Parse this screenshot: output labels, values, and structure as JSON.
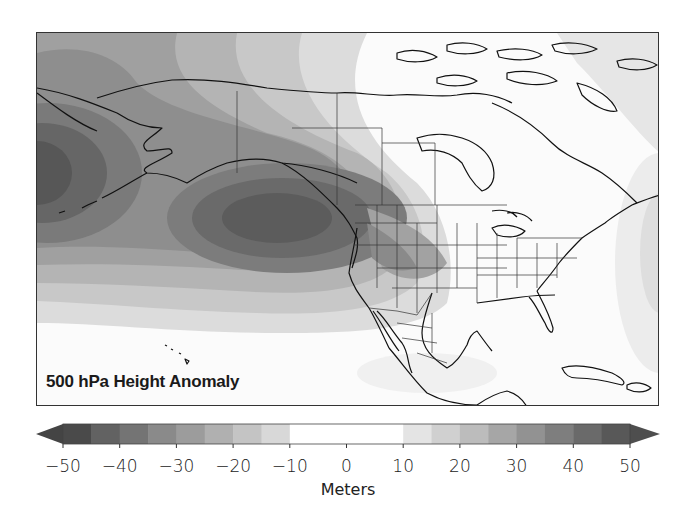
{
  "map": {
    "title": "500 hPa Height Anomaly",
    "region": "North America and North Pacific",
    "projection_extent_px": {
      "left": 36,
      "top": 32,
      "right": 659,
      "bottom": 406
    }
  },
  "colorbar": {
    "unit_label": "Meters",
    "min": -50,
    "max": 50,
    "ticks": [
      "-50",
      "-40",
      "-30",
      "-20",
      "-10",
      "0",
      "10",
      "20",
      "30",
      "40",
      "50"
    ],
    "tick_values": [
      -50,
      -40,
      -30,
      -20,
      -10,
      0,
      10,
      20,
      30,
      40,
      50
    ],
    "extend": "both",
    "levels": [
      -50,
      -45,
      -40,
      -35,
      -30,
      -25,
      -20,
      -15,
      -10,
      -5,
      0,
      5,
      10,
      15,
      20,
      25,
      30,
      35,
      40,
      45,
      50
    ],
    "colors": [
      "#4a4a4a",
      "#626262",
      "#747474",
      "#8a8a8a",
      "#9c9c9c",
      "#b0b0b0",
      "#c4c4c4",
      "#d8d8d8",
      "#ffffff",
      "#ffffff",
      "#ffffff",
      "#ffffff",
      "#e4e4e4",
      "#d0d0d0",
      "#bcbcbc",
      "#a6a6a6",
      "#929292",
      "#7e7e7e",
      "#6a6a6a",
      "#585858"
    ],
    "under_color": "#444444",
    "over_color": "#4e4e4e"
  },
  "chart_data": {
    "type": "heatmap",
    "title": "500 hPa Height Anomaly",
    "colorbar_label": "Meters",
    "colorbar_ticks": [
      -50,
      -40,
      -30,
      -20,
      -10,
      0,
      10,
      20,
      30,
      40,
      50
    ],
    "features": [
      {
        "name": "negative anomaly center",
        "location": "NE Pacific off US West Coast (~40N,135W)",
        "approx_value": -50
      },
      {
        "name": "negative anomaly center",
        "location": "Western Pacific / Aleutians (~45N,170E)",
        "approx_value": -45
      },
      {
        "name": "negative anomaly extension",
        "location": "Western US (California, Nevada, Great Basin)",
        "approx_value": -30
      },
      {
        "name": "near-zero anomaly",
        "location": "Canada, Hudson Bay, Eastern US, Gulf, Caribbean",
        "approx_value": 0
      },
      {
        "name": "weak positive anomaly",
        "location": "Western Atlantic east of US coast",
        "approx_value": 10
      },
      {
        "name": "weak negative anomaly",
        "location": "Arctic / Greenland edge (top right)",
        "approx_value": -15
      }
    ]
  }
}
